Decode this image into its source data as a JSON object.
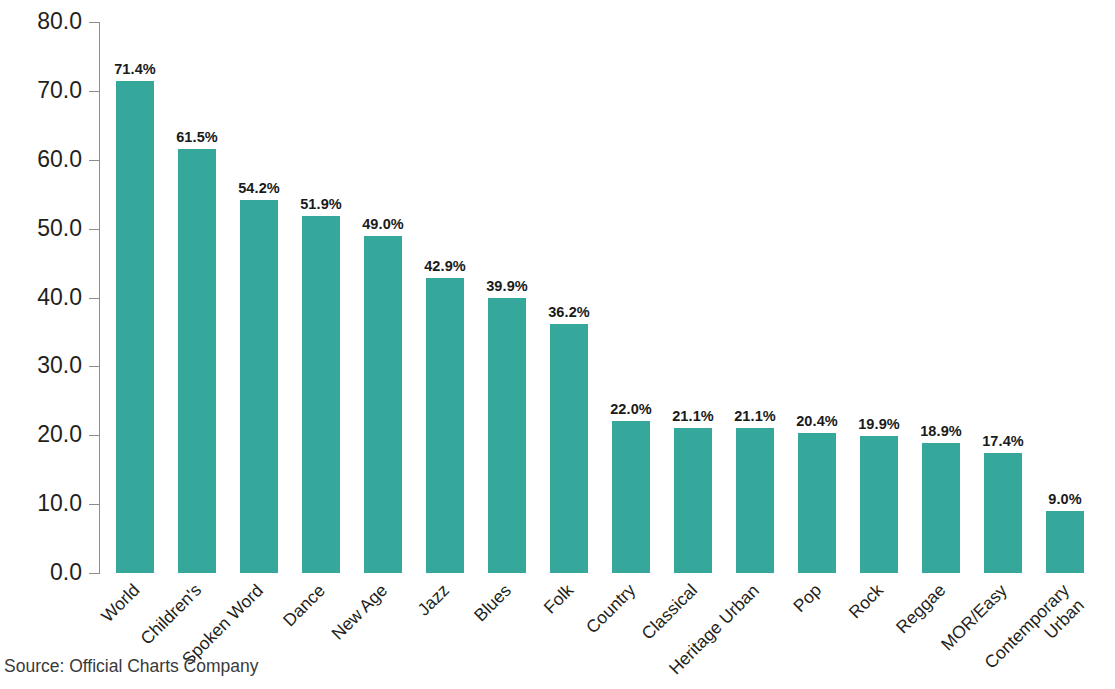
{
  "source_note": "Source: Official Charts Company",
  "axis": {
    "y_ticks": [
      "0.0",
      "10.0",
      "20.0",
      "30.0",
      "40.0",
      "50.0",
      "60.0",
      "70.0",
      "80.0"
    ]
  },
  "colors": {
    "bar": "#36a79b",
    "axis": "#8d8d8d",
    "text": "#231f20",
    "background": "#ffffff"
  },
  "chart_data": {
    "type": "bar",
    "title": "",
    "subtitle": "",
    "xlabel": "",
    "ylabel": "",
    "ylim": [
      0,
      80
    ],
    "ytick_interval": 10,
    "grid": false,
    "legend": false,
    "legend_position": "none",
    "value_suffix": "%",
    "categories": [
      "World",
      "Children's",
      "Spoken Word",
      "Dance",
      "New Age",
      "Jazz",
      "Blues",
      "Folk",
      "Country",
      "Classical",
      "Heritage Urban",
      "Pop",
      "Rock",
      "Reggae",
      "MOR/Easy",
      "Contemporary Urban"
    ],
    "values": [
      71.4,
      61.5,
      54.2,
      51.9,
      49.0,
      42.9,
      39.9,
      36.2,
      22.0,
      21.1,
      21.1,
      20.4,
      19.9,
      18.9,
      17.4,
      9.0
    ],
    "data_labels": [
      "71.4%",
      "61.5%",
      "54.2%",
      "51.9%",
      "49.0%",
      "42.9%",
      "39.9%",
      "36.2%",
      "22.0%",
      "21.1%",
      "21.1%",
      "20.4%",
      "19.9%",
      "18.9%",
      "17.4%",
      "9.0%"
    ],
    "annotations": [
      "Source: Official Charts Company"
    ]
  }
}
